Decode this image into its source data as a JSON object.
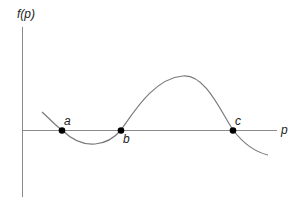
{
  "diagram": {
    "y_axis_label": "f(p)",
    "x_axis_label": "p",
    "points": [
      {
        "label": "a",
        "x": 62,
        "y": 130
      },
      {
        "label": "b",
        "x": 121,
        "y": 130
      },
      {
        "label": "c",
        "x": 233,
        "y": 130
      }
    ],
    "colors": {
      "axis": "#8a8a8a",
      "curve": "#7a7a7a",
      "point": "#000000",
      "text": "#222222"
    }
  }
}
